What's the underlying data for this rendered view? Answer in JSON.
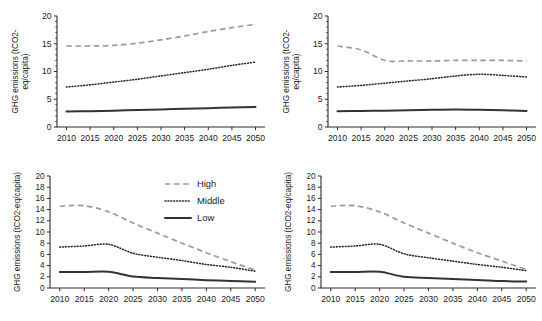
{
  "figure": {
    "panel_count": 4,
    "x_tick_labels": [
      "2010",
      "2015",
      "2020",
      "2025",
      "2030",
      "2035",
      "2040",
      "2045",
      "2050"
    ],
    "legend": {
      "position": "top-right of bottom-left panel",
      "entries": [
        {
          "label": "High",
          "style": "dashed",
          "color": "#9a9a9a"
        },
        {
          "label": "Middle",
          "style": "dotted",
          "color": "#2a2a2a"
        },
        {
          "label": "Low",
          "style": "solid",
          "color": "#333333"
        }
      ]
    }
  },
  "chart_data": [
    {
      "panel": "top-left",
      "type": "line",
      "title": "",
      "xlabel": "",
      "ylabel": "GHG emissions (tCO2-eq/capita)",
      "ylabel_lines": [
        "GHG emissions (tCO2-",
        "eq/capita)"
      ],
      "x": [
        2010,
        2015,
        2020,
        2025,
        2030,
        2035,
        2040,
        2045,
        2050
      ],
      "xlim": [
        2008,
        2052
      ],
      "ylim": [
        0,
        20
      ],
      "yticks": [
        0,
        5,
        10,
        15,
        20
      ],
      "ytick_labels": [
        "0",
        "5",
        "10",
        "15",
        "20"
      ],
      "grid": false,
      "series": [
        {
          "name": "High",
          "values": [
            14.6,
            14.6,
            14.7,
            15.1,
            15.7,
            16.4,
            17.2,
            17.9,
            18.5
          ]
        },
        {
          "name": "Middle",
          "values": [
            7.2,
            7.6,
            8.1,
            8.6,
            9.2,
            9.8,
            10.4,
            11.1,
            11.7
          ]
        },
        {
          "name": "Low",
          "values": [
            2.8,
            2.85,
            2.95,
            3.05,
            3.15,
            3.3,
            3.4,
            3.5,
            3.6
          ]
        }
      ]
    },
    {
      "panel": "top-right",
      "type": "line",
      "title": "",
      "xlabel": "",
      "ylabel": "GHG emissions (tCO2-eq/capita)",
      "ylabel_lines": [
        "GHG emissions (tCO2-",
        "eq/capita)"
      ],
      "x": [
        2010,
        2015,
        2020,
        2025,
        2030,
        2035,
        2040,
        2045,
        2050
      ],
      "xlim": [
        2008,
        2052
      ],
      "ylim": [
        0,
        20
      ],
      "yticks": [
        0,
        5,
        10,
        15,
        20
      ],
      "ytick_labels": [
        "0",
        "5",
        "10",
        "15",
        "20"
      ],
      "grid": false,
      "series": [
        {
          "name": "High",
          "values": [
            14.6,
            13.9,
            12.0,
            11.9,
            11.9,
            12.0,
            12.0,
            12.0,
            11.9
          ]
        },
        {
          "name": "Middle",
          "values": [
            7.2,
            7.5,
            7.9,
            8.3,
            8.7,
            9.2,
            9.5,
            9.3,
            9.0
          ]
        },
        {
          "name": "Low",
          "values": [
            2.85,
            2.9,
            2.95,
            3.0,
            3.1,
            3.15,
            3.1,
            3.0,
            2.9
          ]
        }
      ]
    },
    {
      "panel": "bottom-left",
      "type": "line",
      "title": "",
      "xlabel": "",
      "ylabel": "GHG emissions (tCO2-eq/capita)",
      "ylabel_lines": [
        "GHG emissions (tCO2-eq/capita)"
      ],
      "x": [
        2010,
        2015,
        2020,
        2025,
        2030,
        2035,
        2040,
        2045,
        2050
      ],
      "xlim": [
        2008,
        2052
      ],
      "ylim": [
        0,
        20
      ],
      "yticks": [
        0,
        2,
        4,
        6,
        8,
        10,
        12,
        14,
        16,
        18,
        20
      ],
      "ytick_labels": [
        "0",
        "2",
        "4",
        "6",
        "8",
        "10",
        "12",
        "14",
        "16",
        "18",
        "20"
      ],
      "grid": false,
      "series": [
        {
          "name": "High",
          "values": [
            14.6,
            14.7,
            13.6,
            11.6,
            9.8,
            8.0,
            6.3,
            4.7,
            3.2
          ]
        },
        {
          "name": "Middle",
          "values": [
            7.3,
            7.5,
            7.8,
            6.2,
            5.5,
            4.9,
            4.2,
            3.7,
            3.0
          ]
        },
        {
          "name": "Low",
          "values": [
            2.85,
            2.85,
            2.9,
            2.05,
            1.8,
            1.6,
            1.4,
            1.25,
            1.1
          ]
        }
      ]
    },
    {
      "panel": "bottom-right",
      "type": "line",
      "title": "",
      "xlabel": "",
      "ylabel": "GHG emissions (tCO2-eq/capita)",
      "ylabel_lines": [
        "GHG emissions (tCO2-eq/capita)"
      ],
      "x": [
        2010,
        2015,
        2020,
        2025,
        2030,
        2035,
        2040,
        2045,
        2050
      ],
      "xlim": [
        2008,
        2052
      ],
      "ylim": [
        0,
        20
      ],
      "yticks": [
        0,
        2,
        4,
        6,
        8,
        10,
        12,
        14,
        16,
        18,
        20
      ],
      "ytick_labels": [
        "0",
        "2",
        "4",
        "6",
        "8",
        "10",
        "12",
        "14",
        "16",
        "18",
        "20"
      ],
      "grid": false,
      "series": [
        {
          "name": "High",
          "values": [
            14.6,
            14.7,
            13.6,
            11.6,
            9.8,
            8.0,
            6.3,
            4.8,
            3.3
          ]
        },
        {
          "name": "Middle",
          "values": [
            7.3,
            7.5,
            7.8,
            6.1,
            5.4,
            4.8,
            4.2,
            3.7,
            3.1
          ]
        },
        {
          "name": "Low",
          "values": [
            2.85,
            2.85,
            2.9,
            2.0,
            1.8,
            1.6,
            1.45,
            1.25,
            1.15
          ]
        }
      ]
    }
  ]
}
